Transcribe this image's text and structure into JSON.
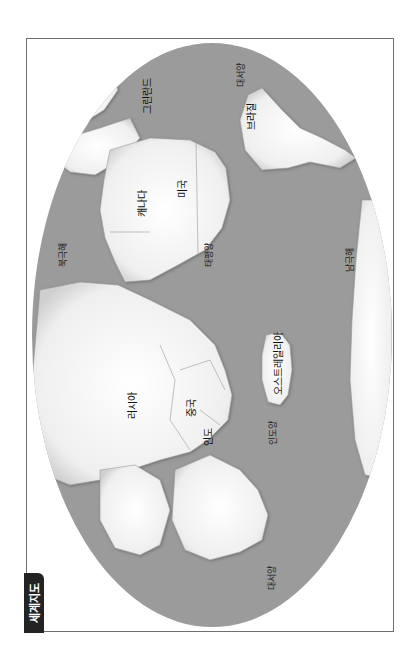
{
  "title": "세계지도",
  "map": {
    "orientation": "rotated -90deg (north at left)",
    "colors": {
      "ocean": "#9b9b9b",
      "land": "#f4f4f4",
      "border": "#8a8a8a",
      "frame": "#6f6f6f",
      "badge": "#232323"
    },
    "oceans": [
      {
        "id": "arctic",
        "label": "북극해"
      },
      {
        "id": "atlantic-top",
        "label": "대서양"
      },
      {
        "id": "pacific",
        "label": "태평양"
      },
      {
        "id": "indian",
        "label": "인도양"
      },
      {
        "id": "southern",
        "label": "남극해"
      },
      {
        "id": "atlantic-bottom",
        "label": "대서양"
      }
    ],
    "countries": [
      {
        "id": "greenland",
        "label": "그린란드"
      },
      {
        "id": "brazil",
        "label": "브라질"
      },
      {
        "id": "canada",
        "label": "캐나다"
      },
      {
        "id": "usa",
        "label": "미국"
      },
      {
        "id": "russia",
        "label": "러시아"
      },
      {
        "id": "china",
        "label": "중국"
      },
      {
        "id": "india",
        "label": "인도"
      },
      {
        "id": "australia",
        "label": "오스트레일리아"
      }
    ]
  }
}
